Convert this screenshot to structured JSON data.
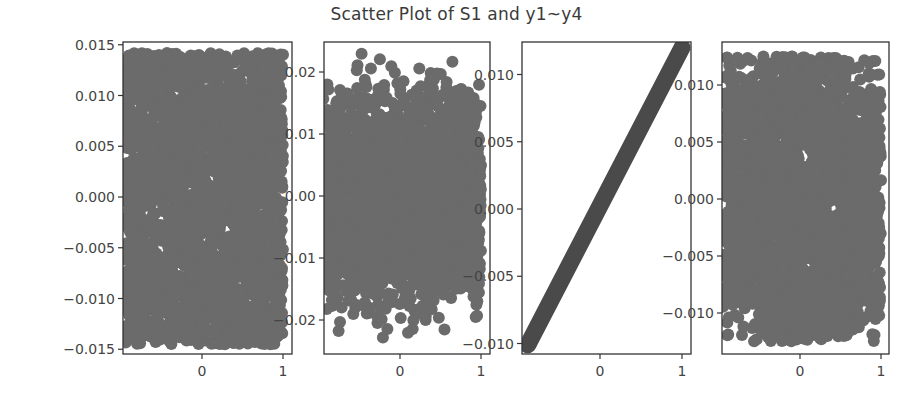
{
  "chart_data": {
    "type": "scatter",
    "title": "Scatter Plot of S1 and y1~y4",
    "layout": "1 row x 4 subplots",
    "marker_color": "#6b6b6b",
    "line_marker_color": "#4a4a4a",
    "subplots": [
      {
        "name": "y1",
        "xlim": [
          -0.95,
          1.05
        ],
        "ylim": [
          -0.0155,
          0.0153
        ],
        "xticks": [
          0,
          1
        ],
        "xtick_labels": [
          "0",
          "1"
        ],
        "yticks": [
          0.015,
          0.01,
          0.005,
          0.0,
          -0.005,
          -0.01,
          -0.015
        ],
        "ytick_labels": [
          "0.015",
          "0.010",
          "0.005",
          "0.000",
          "−0.005",
          "−0.010",
          "−0.015"
        ],
        "distribution": "uniform-like dense cloud",
        "x_range": [
          -0.95,
          1.0
        ],
        "y_range": [
          -0.0145,
          0.0142
        ]
      },
      {
        "name": "y2",
        "xlim": [
          -0.95,
          1.05
        ],
        "ylim": [
          -0.025,
          0.025
        ],
        "xticks": [
          0,
          1
        ],
        "xtick_labels": [
          "0",
          "1"
        ],
        "yticks": [
          0.02,
          0.01,
          0.0,
          -0.01,
          -0.02
        ],
        "ytick_labels": [
          "0.02",
          "0.01",
          "0.00",
          "−0.01",
          "−0.02"
        ],
        "distribution": "cloud narrowing at top and bottom",
        "x_range": [
          -0.95,
          1.0
        ],
        "y_range": [
          -0.023,
          0.024
        ]
      },
      {
        "name": "y3",
        "xlim": [
          -0.95,
          1.05
        ],
        "ylim": [
          -0.0108,
          0.0125
        ],
        "xticks": [
          0,
          1
        ],
        "xtick_labels": [
          "0",
          "1"
        ],
        "yticks": [
          0.01,
          0.005,
          0.0,
          -0.005,
          -0.01
        ],
        "ytick_labels": [
          "0.010",
          "0.005",
          "0.000",
          "−0.005",
          "−0.010"
        ],
        "distribution": "perfect linear relationship",
        "line": {
          "x_start": -0.88,
          "y_start": -0.0101,
          "x_end": 1.0,
          "y_end": 0.012
        }
      },
      {
        "name": "y4",
        "xlim": [
          -0.95,
          1.05
        ],
        "ylim": [
          -0.0135,
          0.0138
        ],
        "xticks": [
          0,
          1
        ],
        "xtick_labels": [
          "0",
          "1"
        ],
        "yticks": [
          0.01,
          0.005,
          0.0,
          -0.005,
          -0.01
        ],
        "ytick_labels": [
          "0.010",
          "0.005",
          "0.000",
          "−0.005",
          "−0.010"
        ],
        "distribution": "dense cloud, rounded top",
        "x_range": [
          -0.95,
          1.0
        ],
        "y_range": [
          -0.0125,
          0.0125
        ]
      }
    ],
    "xlabel": "",
    "ylabel": "",
    "grid": false,
    "legend": null
  }
}
